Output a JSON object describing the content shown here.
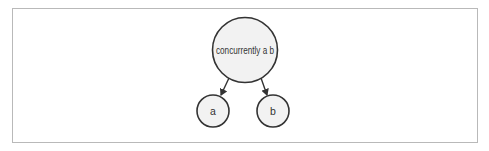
{
  "diagram": {
    "type": "tree",
    "colors": {
      "frame_border": "#b9b9b9",
      "node_fill": "#f2f2f2",
      "node_stroke": "#333333",
      "edge": "#333333",
      "text": "#333333"
    },
    "nodes": [
      {
        "id": "root",
        "label": "concurrently a b"
      },
      {
        "id": "a",
        "label": "a"
      },
      {
        "id": "b",
        "label": "b"
      }
    ],
    "edges": [
      {
        "from": "root",
        "to": "a"
      },
      {
        "from": "root",
        "to": "b"
      }
    ]
  }
}
